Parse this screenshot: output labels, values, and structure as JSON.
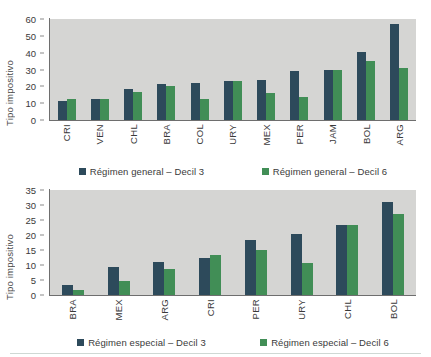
{
  "ylabel_text": "Tipo impositivo",
  "colors": {
    "series1": "#2d4a5b",
    "series2": "#418e56",
    "plot_bg": "#d5d5d3"
  },
  "chart_data": [
    {
      "type": "bar",
      "id": "regimen-general",
      "title": "",
      "xlabel": "",
      "ylabel": "Tipo impositivo",
      "ylim": [
        0,
        60
      ],
      "yticks": [
        0,
        10,
        20,
        30,
        40,
        50,
        60
      ],
      "grid": false,
      "legend_position": "bottom",
      "categories": [
        "CRI",
        "VEN",
        "CHL",
        "BRA",
        "COL",
        "URY",
        "MEX",
        "PER",
        "JAM",
        "BOL",
        "ARG"
      ],
      "series": [
        {
          "name": "Régimen general – Decil 3",
          "color": "#2d4a5b",
          "values": [
            11.2,
            12.5,
            18.3,
            21.3,
            22.0,
            23.4,
            24.0,
            29.0,
            29.7,
            40.5,
            57.3
          ]
        },
        {
          "name": "Régimen general – Decil 6",
          "color": "#418e56",
          "values": [
            12.5,
            12.6,
            16.4,
            20.0,
            12.3,
            23.4,
            16.1,
            13.9,
            29.7,
            35.0,
            31.0
          ]
        }
      ]
    },
    {
      "type": "bar",
      "id": "regimen-especial",
      "title": "",
      "xlabel": "",
      "ylabel": "Tipo impositivo",
      "ylim": [
        0,
        35
      ],
      "yticks": [
        0,
        5,
        10,
        15,
        20,
        25,
        30,
        35
      ],
      "grid": false,
      "legend_position": "bottom",
      "categories": [
        "BRA",
        "MEX",
        "ARG",
        "CRI",
        "PER",
        "URY",
        "CHL",
        "BOL"
      ],
      "series": [
        {
          "name": "Régimen especial – Decil 3",
          "color": "#2d4a5b",
          "values": [
            3.3,
            9.5,
            11.0,
            12.3,
            18.2,
            20.4,
            23.4,
            31.0
          ]
        },
        {
          "name": "Régimen especial – Decil 6",
          "color": "#418e56",
          "values": [
            1.8,
            4.8,
            8.7,
            13.5,
            15.0,
            10.8,
            23.4,
            27.0
          ]
        }
      ]
    }
  ]
}
